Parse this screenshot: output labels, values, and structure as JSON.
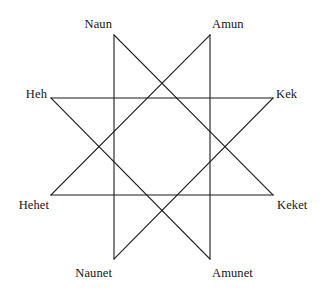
{
  "figure": {
    "name": "ogdoad-octagram",
    "background_color": "#ffffff",
    "line_color": "#1a1a1a",
    "line_width": 1.1,
    "width": 324,
    "height": 293
  },
  "nodes": [
    {
      "id": "naun",
      "label": "Naun",
      "vertex_x": 114,
      "vertex_y": 35,
      "label_x": 112,
      "label_y": 24,
      "anchor": "anchor-right"
    },
    {
      "id": "amun",
      "label": "Amun",
      "vertex_x": 210,
      "vertex_y": 35,
      "label_x": 212,
      "label_y": 24,
      "anchor": "anchor-left"
    },
    {
      "id": "kek",
      "label": "Kek",
      "vertex_x": 273,
      "vertex_y": 98,
      "label_x": 276,
      "label_y": 94,
      "anchor": "anchor-left"
    },
    {
      "id": "keket",
      "label": "Keket",
      "vertex_x": 273,
      "vertex_y": 195,
      "label_x": 277,
      "label_y": 205,
      "anchor": "anchor-left"
    },
    {
      "id": "amunet",
      "label": "Amunet",
      "vertex_x": 210,
      "vertex_y": 259,
      "label_x": 212,
      "label_y": 273,
      "anchor": "anchor-left"
    },
    {
      "id": "naunet",
      "label": "Naunet",
      "vertex_x": 114,
      "vertex_y": 259,
      "label_x": 112,
      "label_y": 273,
      "anchor": "anchor-right"
    },
    {
      "id": "hehet",
      "label": "Hehet",
      "vertex_x": 51,
      "vertex_y": 195,
      "label_x": 49,
      "label_y": 205,
      "anchor": "anchor-right"
    },
    {
      "id": "heh",
      "label": "Heh",
      "vertex_x": 51,
      "vertex_y": 98,
      "label_x": 47,
      "label_y": 94,
      "anchor": "anchor-right"
    }
  ],
  "chart_data": {
    "type": "diagram",
    "diagram_type": "star-polygon",
    "schlafli": "{8/3}",
    "title": "",
    "point_count": 8,
    "step": 3,
    "categories": [
      "Naun",
      "Amun",
      "Kek",
      "Keket",
      "Amunet",
      "Naunet",
      "Hehet",
      "Heh"
    ],
    "vertices": [
      [
        114,
        35
      ],
      [
        210,
        35
      ],
      [
        273,
        98
      ],
      [
        273,
        195
      ],
      [
        210,
        259
      ],
      [
        114,
        259
      ],
      [
        51,
        195
      ],
      [
        51,
        98
      ]
    ],
    "edges": [
      [
        0,
        3
      ],
      [
        3,
        6
      ],
      [
        6,
        1
      ],
      [
        1,
        4
      ],
      [
        4,
        7
      ],
      [
        7,
        2
      ],
      [
        2,
        5
      ],
      [
        5,
        0
      ]
    ],
    "edge_pairs": [
      [
        "Naun",
        "Keket"
      ],
      [
        "Keket",
        "Hehet"
      ],
      [
        "Hehet",
        "Amun"
      ],
      [
        "Amun",
        "Amunet"
      ],
      [
        "Amunet",
        "Heh"
      ],
      [
        "Heh",
        "Kek"
      ],
      [
        "Kek",
        "Naunet"
      ],
      [
        "Naunet",
        "Naun"
      ]
    ],
    "legend": [],
    "grid": false,
    "xlabel": "",
    "ylabel": ""
  }
}
